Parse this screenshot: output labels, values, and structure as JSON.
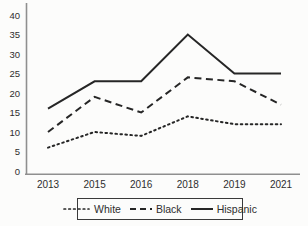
{
  "chart_data": {
    "type": "line",
    "title": "",
    "xlabel": "",
    "ylabel": "",
    "categories": [
      "2013",
      "2015",
      "2016",
      "2018",
      "2019",
      "2021"
    ],
    "series": [
      {
        "name": "White",
        "style": "dotted",
        "values": [
          6,
          10,
          9,
          14,
          12,
          12
        ]
      },
      {
        "name": "Black",
        "style": "dashed",
        "values": [
          10,
          19,
          15,
          24,
          23,
          17
        ]
      },
      {
        "name": "Hispanic",
        "style": "solid",
        "values": [
          16,
          23,
          23,
          35,
          25,
          25
        ]
      }
    ],
    "ylim": [
      0,
      40
    ],
    "yticks": [
      0,
      5,
      10,
      15,
      20,
      25,
      30,
      35,
      40
    ],
    "grid": false,
    "legend_position": "bottom"
  },
  "legend": {
    "items": [
      {
        "label": "White",
        "style": "dotted"
      },
      {
        "label": "Black",
        "style": "dashed"
      },
      {
        "label": "Hispanic",
        "style": "solid"
      }
    ]
  },
  "colors": {
    "background": "#fcfcfb",
    "line": "#262626",
    "axis": "#8f8f8f",
    "text": "#2e2e2e",
    "legend_border": "#3a3a3a"
  }
}
